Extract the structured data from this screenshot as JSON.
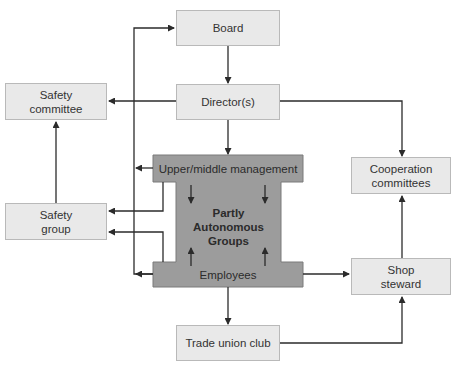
{
  "diagram": {
    "nodes": {
      "board": {
        "label": "Board"
      },
      "directors": {
        "label": "Director(s)"
      },
      "safety_committee": {
        "label": "Safety\ncommittee"
      },
      "safety_group": {
        "label": "Safety\ngroup"
      },
      "cooperation_committees": {
        "label": "Cooperation\ncommittees"
      },
      "shop_steward": {
        "label": "Shop\nsteward"
      },
      "trade_union_club": {
        "label": "Trade union club"
      },
      "upper_middle_management": {
        "label": "Upper/middle management"
      },
      "partly_autonomous_groups": {
        "label": "Partly\nAutonomous\nGroups"
      },
      "employees": {
        "label": "Employees"
      }
    },
    "edges": [
      {
        "from": "Board",
        "to": "Director(s)"
      },
      {
        "from": "Director(s)",
        "to": "Safety committee"
      },
      {
        "from": "Director(s)",
        "to": "Upper/middle management"
      },
      {
        "from": "Director(s)",
        "to": "Cooperation committees"
      },
      {
        "from": "Safety group",
        "to": "Safety committee"
      },
      {
        "from": "Upper/middle management",
        "to": "Safety group"
      },
      {
        "from": "Employees",
        "to": "Safety group"
      },
      {
        "from": "Employees",
        "to": "Board"
      },
      {
        "from": "Upper/middle management",
        "to": "Partly Autonomous Groups"
      },
      {
        "from": "Employees",
        "to": "Partly Autonomous Groups"
      },
      {
        "from": "Employees",
        "to": "Shop steward"
      },
      {
        "from": "Employees",
        "to": "Trade union club"
      },
      {
        "from": "Trade union club",
        "to": "Shop steward"
      },
      {
        "from": "Shop steward",
        "to": "Cooperation committees"
      }
    ],
    "colors": {
      "box_fill": "#e9e9e9",
      "box_border": "#b9b9b9",
      "center_fill": "#9c9c9c",
      "center_border": "#7a7a7a",
      "line": "#2b2b2b"
    }
  }
}
